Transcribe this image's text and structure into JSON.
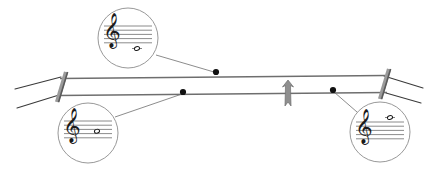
{
  "figure": {
    "name": "string-instrument-harmonics-diagram",
    "title": "String with nodes and corresponding treble-clef pitches",
    "background_color": "#ffffff",
    "line_color": "#6e6e6e",
    "dark_line_color": "#3a3a3a",
    "circle_stroke_color": "#8c8c8c",
    "notation_color": "#1a1a1a",
    "width": 432,
    "height": 171
  },
  "instrument": {
    "strings": [
      {
        "name": "upper-string",
        "x1": 60,
        "y1": 78.5,
        "x2": 385,
        "y2": 75.5,
        "stroke_width": 1.6
      },
      {
        "name": "lower-string",
        "x1": 58,
        "y1": 95.5,
        "x2": 387,
        "y2": 92.5,
        "stroke_width": 1.6
      }
    ],
    "nuts": [
      {
        "name": "left-nut",
        "x1": 57,
        "y1": 102,
        "x2": 66,
        "y2": 72,
        "stroke_width": 4.2
      },
      {
        "name": "right-nut",
        "x1": 380,
        "y1": 99,
        "x2": 389,
        "y2": 69,
        "stroke_width": 4.2
      }
    ],
    "tuning_lines": [
      {
        "name": "peg-line-left-upper",
        "x1": 61,
        "y1": 77,
        "x2": 15,
        "y2": 89
      },
      {
        "name": "peg-line-left-lower",
        "x1": 59,
        "y1": 95,
        "x2": 17,
        "y2": 108
      },
      {
        "name": "peg-line-right-upper",
        "x1": 384,
        "y1": 76,
        "x2": 423,
        "y2": 88
      },
      {
        "name": "peg-line-right-lower",
        "x1": 386,
        "y1": 93,
        "x2": 421,
        "y2": 103
      }
    ],
    "bridge_marker": {
      "name": "bridge-marker",
      "x": 288,
      "y": 93,
      "width": 11,
      "height": 26
    }
  },
  "nodes": [
    {
      "name": "node-upper-string",
      "label": "node on upper string",
      "x": 216,
      "y": 72,
      "radius": 3.1,
      "string": "upper-string"
    },
    {
      "name": "node-lower-left",
      "label": "node on lower string left",
      "x": 183,
      "y": 92,
      "radius": 3.1,
      "string": "lower-string"
    },
    {
      "name": "node-lower-right",
      "label": "node on lower string right",
      "x": 333,
      "y": 90,
      "radius": 3.1,
      "string": "lower-string"
    }
  ],
  "leader_lines": [
    {
      "name": "leader-top-callout",
      "x1": 156,
      "y1": 55,
      "x2": 214,
      "y2": 72
    },
    {
      "name": "leader-left-callout",
      "x1": 115,
      "y1": 117,
      "x2": 182,
      "y2": 94
    },
    {
      "name": "leader-right-callout",
      "x1": 357,
      "y1": 112,
      "x2": 334,
      "y2": 92
    }
  ],
  "callouts": [
    {
      "name": "callout-top",
      "label": "Top callout: treble clef, note below staff on ledger line",
      "cx": 128,
      "cy": 38,
      "r": 30,
      "staff": {
        "x": 104,
        "y": 26,
        "width": 48,
        "line_gap": 4.2,
        "line_count": 5
      },
      "clef": {
        "name": "treble-clef",
        "glyph": "𝄞",
        "x": 112,
        "y": 40,
        "size": 30
      },
      "note": {
        "name": "half-note",
        "glyph": "𝅗𝅥",
        "x": 137,
        "y": 48.5,
        "size": 15,
        "ledger_line": true,
        "ledger_x": 132,
        "ledger_width": 10,
        "ledger_y": 48.5,
        "position_description": "one ledger line below staff"
      }
    },
    {
      "name": "callout-left",
      "label": "Bottom-left callout: treble clef, note on middle staff space",
      "cx": 88,
      "cy": 133,
      "r": 30,
      "staff": {
        "x": 64,
        "y": 121,
        "width": 48,
        "line_gap": 4.2,
        "line_count": 5
      },
      "clef": {
        "name": "treble-clef",
        "glyph": "𝄞",
        "x": 72,
        "y": 135,
        "size": 30
      },
      "note": {
        "name": "half-note",
        "glyph": "𝅗𝅥",
        "x": 97,
        "y": 131.2,
        "size": 15,
        "ledger_line": false,
        "position_description": "middle of staff"
      }
    },
    {
      "name": "callout-right",
      "label": "Bottom-right callout: treble clef, note above staff on ledger line",
      "cx": 380,
      "cy": 132,
      "r": 30,
      "staff": {
        "x": 356,
        "y": 122,
        "width": 48,
        "line_gap": 4.2,
        "line_count": 5
      },
      "clef": {
        "name": "treble-clef",
        "glyph": "𝄞",
        "x": 364,
        "y": 136,
        "size": 30
      },
      "note": {
        "name": "half-note",
        "glyph": "𝅗𝅥",
        "x": 390,
        "y": 117.5,
        "size": 15,
        "ledger_line": true,
        "ledger_x": 385,
        "ledger_width": 10,
        "ledger_y": 117.5,
        "position_description": "one ledger line above staff"
      }
    }
  ]
}
